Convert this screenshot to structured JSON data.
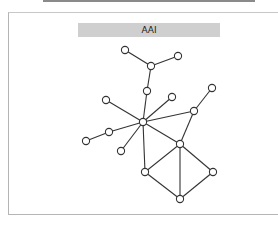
{
  "diagram": {
    "title": "AAI",
    "nodes": [
      {
        "id": "n1",
        "x": 125,
        "y": 50
      },
      {
        "id": "n2",
        "x": 178,
        "y": 56
      },
      {
        "id": "n3",
        "x": 151,
        "y": 66
      },
      {
        "id": "n4",
        "x": 147,
        "y": 91
      },
      {
        "id": "n5",
        "x": 106,
        "y": 100
      },
      {
        "id": "n6",
        "x": 172,
        "y": 97
      },
      {
        "id": "n7",
        "x": 212,
        "y": 88
      },
      {
        "id": "n8",
        "x": 143,
        "y": 122
      },
      {
        "id": "n9",
        "x": 194,
        "y": 111
      },
      {
        "id": "n10",
        "x": 109,
        "y": 132
      },
      {
        "id": "n11",
        "x": 86,
        "y": 141
      },
      {
        "id": "n12",
        "x": 121,
        "y": 151
      },
      {
        "id": "n13",
        "x": 180,
        "y": 144
      },
      {
        "id": "n14",
        "x": 145,
        "y": 172
      },
      {
        "id": "n15",
        "x": 213,
        "y": 172
      },
      {
        "id": "n16",
        "x": 180,
        "y": 199
      }
    ],
    "edges": [
      [
        "n1",
        "n3"
      ],
      [
        "n2",
        "n3"
      ],
      [
        "n3",
        "n4"
      ],
      [
        "n4",
        "n8"
      ],
      [
        "n5",
        "n8"
      ],
      [
        "n6",
        "n8"
      ],
      [
        "n8",
        "n9"
      ],
      [
        "n7",
        "n9"
      ],
      [
        "n8",
        "n10"
      ],
      [
        "n10",
        "n11"
      ],
      [
        "n8",
        "n12"
      ],
      [
        "n8",
        "n13"
      ],
      [
        "n8",
        "n14"
      ],
      [
        "n9",
        "n13"
      ],
      [
        "n13",
        "n14"
      ],
      [
        "n13",
        "n15"
      ],
      [
        "n13",
        "n16"
      ],
      [
        "n14",
        "n16"
      ],
      [
        "n15",
        "n16"
      ]
    ]
  }
}
